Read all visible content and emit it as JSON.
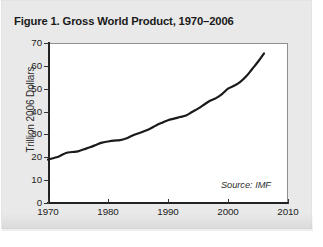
{
  "figure": {
    "title": "Figure 1. Gross World Product, 1970–2006",
    "source_note": "Source: IMF"
  },
  "colors": {
    "page_background": "#e9e9e9",
    "plot_background": "#ffffff",
    "axis": "#222222",
    "frame": "#8e8e8e",
    "series_line": "#1a1a1a",
    "text": "#1a1a1a"
  },
  "axes": {
    "y_title": "Trillion 2006 Dollars",
    "y_ticks": [
      "0",
      "10",
      "20",
      "30",
      "40",
      "50",
      "60",
      "70"
    ],
    "x_ticks": [
      "1970",
      "1980",
      "1990",
      "2000",
      "2010"
    ]
  },
  "chart_data": {
    "type": "line",
    "title": "Figure 1. Gross World Product, 1970–2006",
    "xlabel": "",
    "ylabel": "Trillion 2006 Dollars",
    "xlim": [
      1970,
      2010
    ],
    "ylim": [
      0,
      70
    ],
    "ytick_values": [
      0,
      10,
      20,
      30,
      40,
      50,
      60,
      70
    ],
    "xtick_values": [
      1970,
      1980,
      1990,
      2000,
      2010
    ],
    "grid": false,
    "legend": false,
    "annotations": [
      {
        "text": "Source: IMF",
        "position": "inside-bottom-right",
        "style": "italic"
      }
    ],
    "series": [
      {
        "name": "Gross World Product",
        "color": "#1a1a1a",
        "line_width": 2.2,
        "x": [
          1970,
          1971,
          1972,
          1973,
          1974,
          1975,
          1976,
          1977,
          1978,
          1979,
          1980,
          1981,
          1982,
          1983,
          1984,
          1985,
          1986,
          1987,
          1988,
          1989,
          1990,
          1991,
          1992,
          1993,
          1994,
          1995,
          1996,
          1997,
          1998,
          1999,
          2000,
          2001,
          2002,
          2003,
          2004,
          2005,
          2006
        ],
        "values": [
          19.0,
          19.7,
          20.6,
          21.9,
          22.3,
          22.6,
          23.5,
          24.4,
          25.4,
          26.4,
          26.9,
          27.3,
          27.5,
          28.2,
          29.4,
          30.4,
          31.4,
          32.5,
          33.9,
          35.1,
          36.2,
          36.9,
          37.6,
          38.3,
          39.8,
          41.3,
          43.0,
          44.7,
          45.9,
          47.6,
          50.0,
          51.3,
          52.9,
          55.3,
          58.5,
          61.8,
          65.5
        ]
      }
    ]
  }
}
